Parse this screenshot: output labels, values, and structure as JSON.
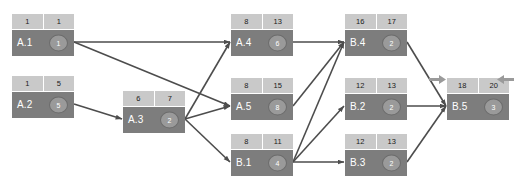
{
  "diagram": {
    "type": "activity-network",
    "colors": {
      "node_header_bg": "#c9c9c9",
      "node_body_bg": "#7d7d7d",
      "node_label_text": "#ffffff",
      "node_circle_bg": "#9a9a9a",
      "edge_stroke": "#4d4d4d",
      "side_arrow_fill": "#9a9a9a",
      "canvas_bg": "#ffffff"
    },
    "nodes": [
      {
        "id": "A1",
        "label": "A.1",
        "early": "1",
        "late": "1",
        "duration": "1",
        "x": 12,
        "y": 14
      },
      {
        "id": "A2",
        "label": "A.2",
        "early": "1",
        "late": "5",
        "duration": "5",
        "x": 12,
        "y": 76
      },
      {
        "id": "A3",
        "label": "A.3",
        "early": "6",
        "late": "7",
        "duration": "2",
        "x": 123,
        "y": 91
      },
      {
        "id": "A4",
        "label": "A.4",
        "early": "8",
        "late": "13",
        "duration": "6",
        "x": 231,
        "y": 14
      },
      {
        "id": "A5",
        "label": "A.5",
        "early": "8",
        "late": "15",
        "duration": "8",
        "x": 231,
        "y": 78
      },
      {
        "id": "B1",
        "label": "B.1",
        "early": "8",
        "late": "11",
        "duration": "4",
        "x": 231,
        "y": 134
      },
      {
        "id": "B4",
        "label": "B.4",
        "early": "16",
        "late": "17",
        "duration": "2",
        "x": 345,
        "y": 14
      },
      {
        "id": "B2",
        "label": "B.2",
        "early": "12",
        "late": "13",
        "duration": "2",
        "x": 345,
        "y": 78
      },
      {
        "id": "B3",
        "label": "B.3",
        "early": "12",
        "late": "13",
        "duration": "2",
        "x": 345,
        "y": 134
      },
      {
        "id": "B5",
        "label": "B.5",
        "early": "18",
        "late": "20",
        "duration": "3",
        "x": 447,
        "y": 78
      }
    ],
    "edges": [
      {
        "from": "A1",
        "to": "A4"
      },
      {
        "from": "A1",
        "to": "A5"
      },
      {
        "from": "A2",
        "to": "A3"
      },
      {
        "from": "A3",
        "to": "A4"
      },
      {
        "from": "A3",
        "to": "A5"
      },
      {
        "from": "A3",
        "to": "B1"
      },
      {
        "from": "A4",
        "to": "B4"
      },
      {
        "from": "A5",
        "to": "B4"
      },
      {
        "from": "B1",
        "to": "B4"
      },
      {
        "from": "B1",
        "to": "B2"
      },
      {
        "from": "B1",
        "to": "B3"
      },
      {
        "from": "B4",
        "to": "B5"
      },
      {
        "from": "B2",
        "to": "B5"
      },
      {
        "from": "B3",
        "to": "B5"
      }
    ],
    "side_arrows": [
      {
        "name": "left-marker-arrow",
        "direction": "right",
        "x": 429,
        "y": 74
      },
      {
        "name": "right-marker-arrow",
        "direction": "left",
        "x": 496,
        "y": 74
      }
    ]
  }
}
